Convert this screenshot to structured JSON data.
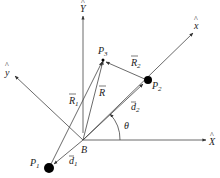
{
  "diagram": {
    "type": "vector-geometry",
    "axes": {
      "X_hat": "X",
      "Y_hat": "Y",
      "x_hat": "x",
      "y_hat": "y"
    },
    "points": {
      "B": "B",
      "P1": "P",
      "P1_sub": "1",
      "P2": "P",
      "P2_sub": "2",
      "P3": "P",
      "P3_sub": "3"
    },
    "vectors": {
      "R": "R",
      "R1": "R",
      "R1_sub": "1",
      "R2": "R",
      "R2_sub": "2",
      "d1": "d",
      "d1_sub": "1",
      "d2": "d",
      "d2_sub": "2"
    },
    "angle": "θ",
    "colors": {
      "line": "#444444",
      "point": "#000000"
    }
  }
}
